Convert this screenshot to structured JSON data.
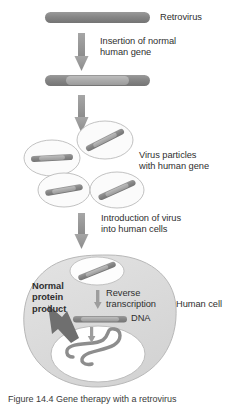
{
  "figure": {
    "caption": "Figure 14.4 Gene therapy with a retrovirus",
    "colors": {
      "virus_body": "#8c8c8c",
      "virus_body_dark": "#7a7a7a",
      "inserted_gene": "#a8a8a8",
      "arrow": "#9a9a9a",
      "arrow_dark": "#6f6f6f",
      "cell_fill": "#dcdcdc",
      "cell_stroke": "#b4b4b4",
      "nucleus_fill": "#ffffff",
      "particle_stroke": "#b0b0b0",
      "text": "#2f2f2f",
      "background": "#ffffff"
    }
  },
  "steps": [
    {
      "id": "retrovirus",
      "label": "Retrovirus",
      "icon": "virus-rod-icon"
    },
    {
      "id": "insertion",
      "label": "Insertion of normal\nhuman gene",
      "icon": "down-arrow-icon"
    },
    {
      "id": "recombinant-virus",
      "label": "",
      "icon": "virus-rod-with-gene-icon"
    },
    {
      "id": "virus-particles",
      "label": "Virus particles\nwith human gene",
      "icon": "down-arrow-icon"
    },
    {
      "id": "introduction",
      "label": "Introduction of virus\ninto human cells",
      "icon": "down-arrow-icon"
    }
  ],
  "cell": {
    "label": "Human cell",
    "parts": [
      {
        "id": "protein-product",
        "label": "Normal\nprotein\nproduct",
        "icon": "thick-arrow-icon"
      },
      {
        "id": "reverse-transcription",
        "label": "Reverse\ntranscription",
        "icon": "down-arrow-icon"
      },
      {
        "id": "dna",
        "label": "DNA",
        "icon": "dna-bar-icon"
      },
      {
        "id": "nucleus",
        "label": "",
        "icon": "chromosome-squiggle-icon"
      },
      {
        "id": "engulfed-virus",
        "label": "",
        "icon": "virus-rod-icon"
      }
    ]
  },
  "particles": {
    "count": 4,
    "label": "Virus particles\nwith human gene"
  }
}
